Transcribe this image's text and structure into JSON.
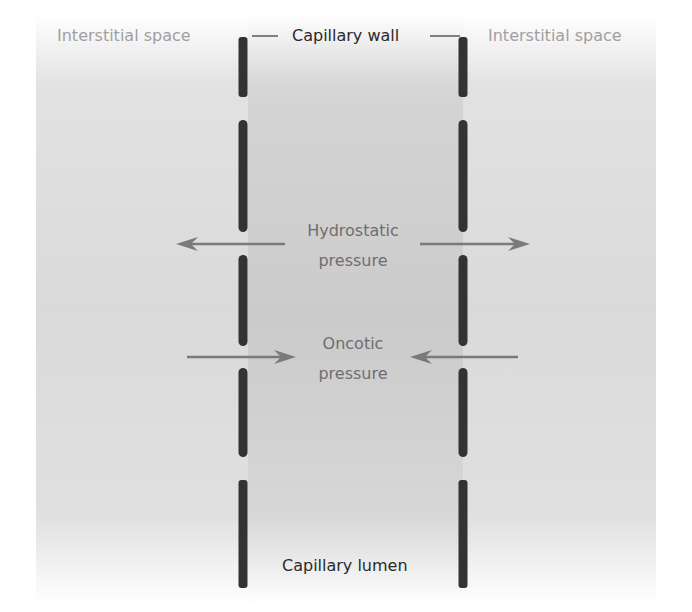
{
  "diagram": {
    "labels": {
      "interstitial_left": "Interstitial space",
      "interstitial_right": "Interstitial space",
      "capillary_wall": "Capillary wall",
      "hydrostatic_line1": "Hydrostatic",
      "hydrostatic_line2": "pressure",
      "oncotic_line1": "Oncotic",
      "oncotic_line2": "pressure",
      "capillary_lumen": "Capillary lumen"
    },
    "forces": [
      {
        "name": "Hydrostatic pressure",
        "direction": "outward"
      },
      {
        "name": "Oncotic pressure",
        "direction": "inward"
      }
    ],
    "colors": {
      "wall": "#333333",
      "arrow": "#7a7a7a",
      "label_light": "#a0a0a0",
      "label_mid": "#6e6e6e",
      "label_dark": "#2a2a2a",
      "background": "#dadada"
    },
    "wall_segments_per_side": 5
  }
}
